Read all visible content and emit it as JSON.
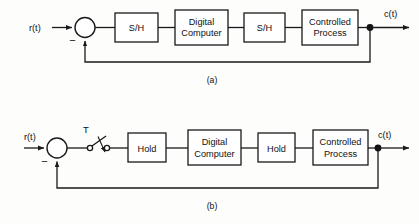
{
  "figure": {
    "type": "block-diagram",
    "panels": [
      {
        "id": "a",
        "caption": "(a)",
        "input_label": "r(t)",
        "output_label": "c(t)",
        "summing_junction": {
          "feedback_sign": "−",
          "name": "summing-junction"
        },
        "blocks": [
          {
            "label": "S/H",
            "name": "sample-hold-input"
          },
          {
            "label_line1": "Digital",
            "label_line2": "Computer",
            "name": "digital-computer"
          },
          {
            "label": "S/H",
            "name": "sample-hold-output"
          },
          {
            "label_line1": "Controlled",
            "label_line2": "Process",
            "name": "controlled-process"
          }
        ],
        "feedback_path": "unity feedback from output node to summing junction"
      },
      {
        "id": "b",
        "caption": "(b)",
        "input_label": "r(t)",
        "output_label": "c(t)",
        "sampler_label": "T",
        "summing_junction": {
          "feedback_sign": "−",
          "name": "summing-junction"
        },
        "blocks": [
          {
            "label": "Hold",
            "name": "hold-input"
          },
          {
            "label_line1": "Digital",
            "label_line2": "Computer",
            "name": "digital-computer"
          },
          {
            "label": "Hold",
            "name": "hold-output"
          },
          {
            "label_line1": "Controlled",
            "label_line2": "Process",
            "name": "controlled-process"
          }
        ],
        "feedback_path": "unity feedback from output node to summing junction"
      }
    ]
  },
  "colors": {
    "line": "#1a1a1a",
    "background": "#fdfdfc",
    "block_fill": "#ffffff"
  }
}
